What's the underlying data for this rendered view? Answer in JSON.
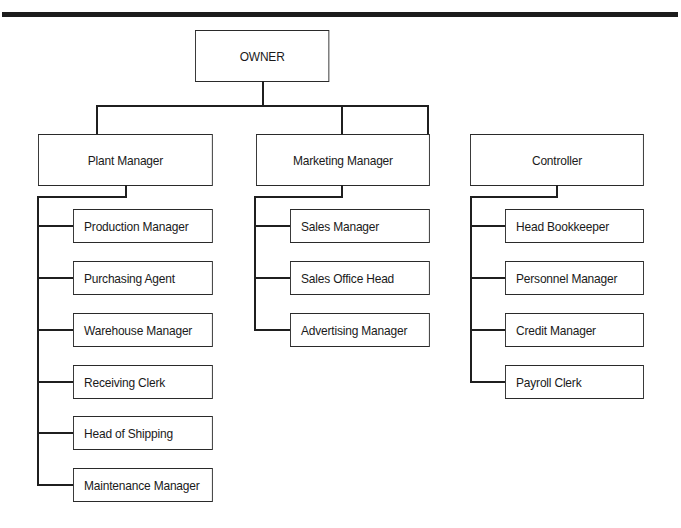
{
  "chart_title": "",
  "top": {
    "label": "OWNER"
  },
  "departments": [
    {
      "label": "Plant Manager",
      "reports": [
        "Production Manager",
        "Purchasing Agent",
        "Warehouse Manager",
        "Receiving Clerk",
        "Head of Shipping",
        "Maintenance Manager"
      ]
    },
    {
      "label": "Marketing Manager",
      "reports": [
        "Sales Manager",
        "Sales Office Head",
        "Advertising Manager"
      ]
    },
    {
      "label": "Controller",
      "reports": [
        "Head Bookkeeper",
        "Personnel Manager",
        "Credit Manager",
        "Payroll Clerk"
      ]
    }
  ]
}
